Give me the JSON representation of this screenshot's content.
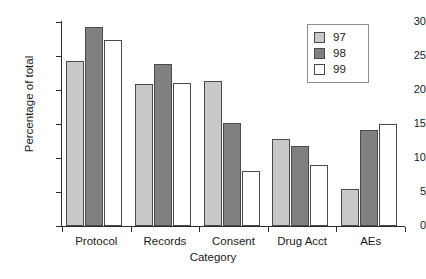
{
  "chart_data": {
    "type": "bar",
    "title": "",
    "title_clipped_note": "",
    "xlabel": "Category",
    "ylabel": "Percentage of total",
    "categories": [
      "Protocol",
      "Records",
      "Consent",
      "Drug Acct",
      "AEs"
    ],
    "series": [
      {
        "name": "97",
        "color": "#c8c8c8",
        "values": [
          24.2,
          20.9,
          21.3,
          12.8,
          5.4
        ]
      },
      {
        "name": "98",
        "color": "#808080",
        "values": [
          29.2,
          23.8,
          15.2,
          11.7,
          14.1
        ]
      },
      {
        "name": "99",
        "color": "#ffffff",
        "values": [
          27.3,
          21.0,
          8.1,
          9.0,
          15.0
        ]
      }
    ],
    "ylim": [
      0,
      30
    ],
    "yticks": [
      0,
      5,
      10,
      15,
      20,
      25,
      30
    ],
    "ytick_labels": [
      "0",
      "5",
      "10",
      "15",
      "20",
      "25",
      "30"
    ],
    "grid": false,
    "legend_position": "top-right",
    "bar_edge_color": "#4a4a4a"
  },
  "legend": {
    "entries": [
      {
        "label": "97"
      },
      {
        "label": "98"
      },
      {
        "label": "99"
      }
    ]
  }
}
